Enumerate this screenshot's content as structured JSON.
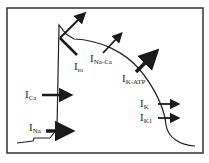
{
  "diagram": {
    "colors": {
      "line": "#222222",
      "arrow": "#1a1a1a",
      "frame": "#333333",
      "background": "#ffffff"
    },
    "currents": [
      {
        "id": "ito",
        "main": "I",
        "sub": "to",
        "direction": "outward"
      },
      {
        "id": "inaca",
        "main": "I",
        "sub": "Na-Ca",
        "direction": "outward"
      },
      {
        "id": "ikatp",
        "main": "I",
        "sub": "K-ATP",
        "direction": "outward"
      },
      {
        "id": "ica",
        "main": "I",
        "sub": "Ca",
        "direction": "inward"
      },
      {
        "id": "ik",
        "main": "I",
        "sub": "K",
        "direction": "outward"
      },
      {
        "id": "ik1",
        "main": "I",
        "sub": "K1",
        "direction": "outward"
      },
      {
        "id": "ina",
        "main": "I",
        "sub": "Na",
        "direction": "inward"
      }
    ]
  }
}
